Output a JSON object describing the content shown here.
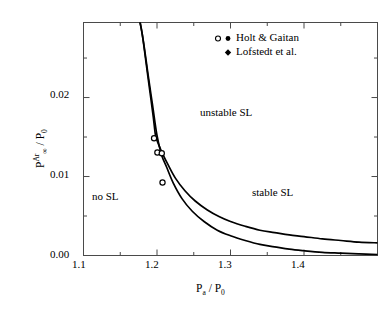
{
  "chart_data": {
    "type": "line",
    "title": "",
    "xlabel": "P_a / P_0",
    "ylabel": "P_inf^Ar / P_0",
    "xlim": [
      1.1,
      1.5
    ],
    "ylim": [
      0.0,
      0.0295
    ],
    "grid": false,
    "xticks": [
      "1.1",
      "1.2",
      "1.3",
      "1.4"
    ],
    "xtick_values": [
      1.1,
      1.2,
      1.3,
      1.4
    ],
    "xminor_values": [
      1.15,
      1.25,
      1.35,
      1.45
    ],
    "yticks": [
      "0.00",
      "0.01",
      "0.02"
    ],
    "ytick_values": [
      0.0,
      0.01,
      0.02
    ],
    "yminor_values": [
      0.005,
      0.015,
      0.025
    ],
    "legend_position": "top-right",
    "series": [
      {
        "name": "upper-threshold-curve",
        "style": "solid-line",
        "x": [
          1.177,
          1.18,
          1.185,
          1.19,
          1.195,
          1.198,
          1.202,
          1.208,
          1.215,
          1.225,
          1.238,
          1.252,
          1.268,
          1.285,
          1.3,
          1.32,
          1.34,
          1.36,
          1.38,
          1.4,
          1.425,
          1.45,
          1.475,
          1.5
        ],
        "y": [
          0.0295,
          0.028,
          0.0245,
          0.021,
          0.0175,
          0.0152,
          0.0141,
          0.0128,
          0.0115,
          0.0098,
          0.0082,
          0.0069,
          0.0058,
          0.0049,
          0.0043,
          0.0037,
          0.0032,
          0.0029,
          0.0026,
          0.0024,
          0.0021,
          0.0019,
          0.0017,
          0.0016
        ]
      },
      {
        "name": "lower-threshold-curve",
        "style": "solid-line",
        "x": [
          1.177,
          1.182,
          1.188,
          1.194,
          1.2,
          1.206,
          1.213,
          1.222,
          1.234,
          1.248,
          1.264,
          1.282,
          1.3,
          1.32,
          1.34,
          1.36,
          1.38,
          1.4,
          1.425,
          1.45,
          1.475,
          1.5
        ],
        "y": [
          0.0295,
          0.0268,
          0.0228,
          0.019,
          0.0152,
          0.0128,
          0.0112,
          0.0092,
          0.0072,
          0.0056,
          0.0043,
          0.0032,
          0.0025,
          0.0019,
          0.0014,
          0.0011,
          0.0008,
          0.0006,
          0.0004,
          0.0003,
          0.0002,
          0.0001
        ]
      }
    ],
    "scatter": [
      {
        "name": "Holt & Gaitan",
        "marker": "open-circle",
        "points": [
          {
            "x": 1.196,
            "y": 0.01485
          },
          {
            "x": 1.2005,
            "y": 0.01305
          },
          {
            "x": 1.2065,
            "y": 0.01295
          },
          {
            "x": 1.2075,
            "y": 0.00925
          }
        ]
      },
      {
        "name": "Lofstedt et al.",
        "marker": "filled-diamond",
        "points": [
          {
            "x": 1.31,
            "y": 0.00165
          },
          {
            "x": 1.33,
            "y": 0.00205
          },
          {
            "x": 1.336,
            "y": 0.002
          },
          {
            "x": 1.343,
            "y": 0.00195
          },
          {
            "x": 1.352,
            "y": 0.00215
          },
          {
            "x": 1.357,
            "y": 0.002
          },
          {
            "x": 1.366,
            "y": 0.0021
          },
          {
            "x": 1.374,
            "y": 0.00198
          },
          {
            "x": 1.381,
            "y": 0.002
          },
          {
            "x": 1.392,
            "y": 0.00215
          },
          {
            "x": 1.397,
            "y": 0.00205
          },
          {
            "x": 1.401,
            "y": 0.00195
          },
          {
            "x": 1.399,
            "y": 0.00025
          }
        ]
      }
    ],
    "annotations": [
      {
        "text": "unstable SL",
        "x": 1.265,
        "y": 0.0196
      },
      {
        "text": "stable SL",
        "x": 1.335,
        "y": 0.0082
      },
      {
        "text": "no SL",
        "x": 1.148,
        "y": 0.0075
      }
    ]
  },
  "axes": {
    "x_title_main": "P",
    "x_title_sub": "a",
    "x_title_sep": " / P",
    "x_title_sub2": "0",
    "y_title_main": "P",
    "y_title_sup": "Ar",
    "y_title_sub": "∞",
    "y_title_sep": " / P",
    "y_title_sub2": "0",
    "xtick_labels": [
      "1.1",
      "1.2",
      "1.3",
      "1.4"
    ],
    "ytick_labels": [
      "0.00",
      "0.01",
      "0.02"
    ]
  },
  "legend": {
    "entries": [
      {
        "label": "Holt & Gaitan",
        "markers": [
          "open-circle",
          "filled-circle"
        ]
      },
      {
        "label": "Lofstedt et al.",
        "markers": [
          "filled-diamond"
        ]
      }
    ]
  },
  "regions": {
    "unstable": "unstable SL",
    "stable": "stable SL",
    "none": "no SL"
  },
  "colors": {
    "line": "#000000",
    "axis": "#4a4a4a",
    "text": "#000000",
    "background": "#ffffff"
  }
}
